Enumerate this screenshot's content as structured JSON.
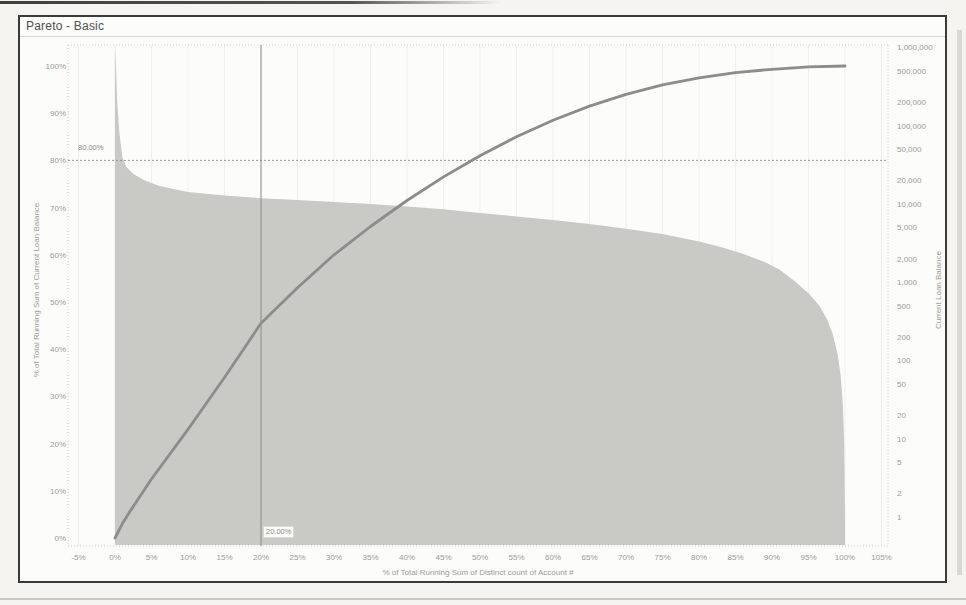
{
  "page": {
    "title": "Pareto - Basic"
  },
  "colors": {
    "line": "#8c8c8c",
    "area": "#c9c9c6",
    "reference_line": "#9a9a94",
    "gridline": "#f0efe9",
    "ruler": "#cfcec7",
    "tick_text": "#9b9b95",
    "title_text": "#4f4f4f",
    "frame_border": "#3a3a3a",
    "plot_background": "#fcfcfb"
  },
  "annotations": {
    "ref80": "80.00%",
    "ref20": "20.00%"
  },
  "axes": {
    "left": {
      "title": "% of Total Running Sum of Current Loan Balance",
      "ticks": [
        {
          "label": "0%",
          "value": 0
        },
        {
          "label": "10%",
          "value": 10
        },
        {
          "label": "20%",
          "value": 20
        },
        {
          "label": "30%",
          "value": 30
        },
        {
          "label": "40%",
          "value": 40
        },
        {
          "label": "50%",
          "value": 50
        },
        {
          "label": "60%",
          "value": 60
        },
        {
          "label": "70%",
          "value": 70
        },
        {
          "label": "80%",
          "value": 80
        },
        {
          "label": "90%",
          "value": 90
        },
        {
          "label": "100%",
          "value": 100
        }
      ]
    },
    "right": {
      "title": "Current Loan Balance",
      "scale": "log",
      "ticks": [
        {
          "label": "1,000,000",
          "value": 1000000
        },
        {
          "label": "500,000",
          "value": 500000
        },
        {
          "label": "200,000",
          "value": 200000
        },
        {
          "label": "100,000",
          "value": 100000
        },
        {
          "label": "50,000",
          "value": 50000
        },
        {
          "label": "20,000",
          "value": 20000
        },
        {
          "label": "10,000",
          "value": 10000
        },
        {
          "label": "5,000",
          "value": 5000
        },
        {
          "label": "2,000",
          "value": 2000
        },
        {
          "label": "1,000",
          "value": 1000
        },
        {
          "label": "500",
          "value": 500
        },
        {
          "label": "200",
          "value": 200
        },
        {
          "label": "100",
          "value": 100
        },
        {
          "label": "50",
          "value": 50
        },
        {
          "label": "20",
          "value": 20
        },
        {
          "label": "10",
          "value": 10
        },
        {
          "label": "5",
          "value": 5
        },
        {
          "label": "2",
          "value": 2
        },
        {
          "label": "1",
          "value": 1
        }
      ]
    },
    "bottom": {
      "title": "% of Total Running Sum of Distinct count of Account #",
      "ticks": [
        {
          "label": "-5%",
          "value": -5
        },
        {
          "label": "0%",
          "value": 0
        },
        {
          "label": "5%",
          "value": 5
        },
        {
          "label": "10%",
          "value": 10
        },
        {
          "label": "15%",
          "value": 15
        },
        {
          "label": "20%",
          "value": 20
        },
        {
          "label": "25%",
          "value": 25
        },
        {
          "label": "30%",
          "value": 30
        },
        {
          "label": "35%",
          "value": 35
        },
        {
          "label": "40%",
          "value": 40
        },
        {
          "label": "45%",
          "value": 45
        },
        {
          "label": "50%",
          "value": 50
        },
        {
          "label": "55%",
          "value": 55
        },
        {
          "label": "60%",
          "value": 60
        },
        {
          "label": "65%",
          "value": 65
        },
        {
          "label": "70%",
          "value": 70
        },
        {
          "label": "75%",
          "value": 75
        },
        {
          "label": "80%",
          "value": 80
        },
        {
          "label": "85%",
          "value": 85
        },
        {
          "label": "90%",
          "value": 90
        },
        {
          "label": "95%",
          "value": 95
        },
        {
          "label": "100%",
          "value": 100
        },
        {
          "label": "105%",
          "value": 105
        }
      ]
    }
  },
  "chart_data": {
    "type": "area",
    "title": "Pareto - Basic",
    "xlabel": "% of Total Running Sum of Distinct count of Account #",
    "ylabel_left": "% of Total Running Sum of Current Loan Balance",
    "ylabel_right": "Current Loan Balance",
    "x_range": [
      -5,
      105
    ],
    "y_left_range": [
      0,
      100
    ],
    "y_right_range": [
      1,
      1000000
    ],
    "y_right_scale": "log",
    "grid": "faint-vertical",
    "legend": "none",
    "reference_lines": [
      {
        "axis": "y-left",
        "value": 80,
        "label": "80.00%",
        "style": "dotted-horizontal"
      },
      {
        "axis": "x",
        "value": 20,
        "label": "20.00%",
        "style": "solid-vertical"
      }
    ],
    "series": [
      {
        "name": "Cumulative % of total Current Loan Balance",
        "type": "line",
        "axis": "left",
        "x": [
          0,
          1,
          2,
          5,
          10,
          15,
          20,
          25,
          30,
          35,
          40,
          45,
          50,
          55,
          60,
          65,
          70,
          75,
          80,
          85,
          90,
          95,
          100
        ],
        "y": [
          0,
          3,
          5.5,
          12.5,
          23,
          34,
          45.5,
          53,
          60,
          66,
          71.5,
          76.5,
          81,
          85,
          88.5,
          91.5,
          94,
          96,
          97.5,
          98.6,
          99.3,
          99.8,
          100
        ]
      },
      {
        "name": "Current Loan Balance (sorted descending)",
        "type": "area",
        "axis": "right",
        "x": [
          0,
          0.15,
          0.3,
          0.6,
          1,
          1.5,
          2.5,
          4,
          6,
          8,
          10,
          15,
          20,
          25,
          30,
          35,
          40,
          45,
          50,
          55,
          60,
          65,
          70,
          75,
          80,
          83,
          86,
          89,
          91,
          93,
          95,
          96.5,
          97.5,
          98.3,
          99,
          99.4,
          99.7,
          99.9,
          100
        ],
        "y": [
          1000000,
          500000,
          200000,
          80000,
          40000,
          30000,
          24000,
          20000,
          17000,
          15500,
          14200,
          12800,
          11800,
          11200,
          10500,
          9900,
          9200,
          8500,
          7600,
          6900,
          6200,
          5500,
          4800,
          4100,
          3300,
          2800,
          2300,
          1800,
          1450,
          1050,
          720,
          500,
          340,
          220,
          120,
          65,
          28,
          8,
          1
        ]
      }
    ]
  }
}
